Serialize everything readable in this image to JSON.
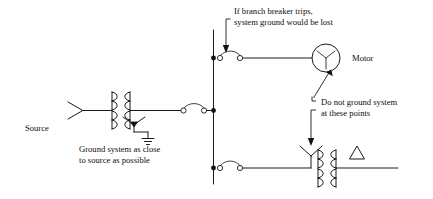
{
  "diagram": {
    "colors": {
      "line": "#1a1a1a",
      "text": "#0d0d0d",
      "background": "#ffffff",
      "node_fill": "#111111",
      "terminal_fill": "#ffffff"
    },
    "labels": {
      "source": "Source",
      "motor": "Motor",
      "ground_note_line1": "Ground system as close",
      "ground_note_line2": "to source as possible",
      "breaker_note_line1": "If branch breaker trips,",
      "breaker_note_line2": "system ground would be lost",
      "do_not_ground_line1": "Do not ground system",
      "do_not_ground_line2": "at these points"
    },
    "symbols": {
      "source_wye": "source-wye-symbol",
      "source_transformer": "two-winding-transformer",
      "neutral_ground_wye": "wye-neutral-ground-symbol",
      "earth_ground": "earth-ground-symbol",
      "source_breaker": "disconnect-switch",
      "branch_breaker_top": "disconnect-switch",
      "branch_breaker_bottom": "disconnect-switch",
      "motor_symbol": "motor-wye-circle",
      "load_transformer": "wye-delta-transformer",
      "delta_symbol": "delta-winding-symbol",
      "bus": "vertical-bus-bar"
    }
  }
}
